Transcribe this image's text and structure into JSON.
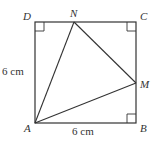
{
  "diagram": {
    "type": "geometry",
    "shape": "square ABCD with inscribed triangle AMN",
    "vertices": {
      "A": {
        "label": "A"
      },
      "B": {
        "label": "B"
      },
      "C": {
        "label": "C"
      },
      "D": {
        "label": "D"
      },
      "M": {
        "label": "M"
      },
      "N": {
        "label": "N"
      }
    },
    "dimensions": {
      "left_side": "6 cm",
      "bottom_side": "6 cm"
    },
    "right_angles": [
      "D",
      "C",
      "B"
    ],
    "stroke_color": "#333333"
  }
}
